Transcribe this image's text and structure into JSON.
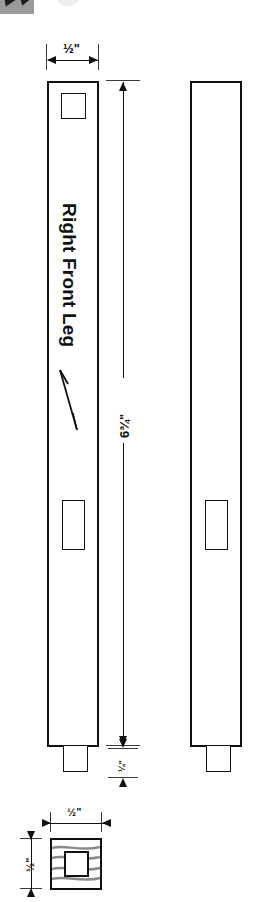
{
  "drawing": {
    "part_label": "Right Front Leg",
    "grain_arrow_icon": "grain-direction-arrow-icon",
    "front_view": {
      "name": "right-front-leg-front-view",
      "width_dimension": "½\"",
      "length_dimension": "6¾\"",
      "tenon_dimension": "¼\""
    },
    "side_view": {
      "name": "right-front-leg-side-view"
    },
    "section_view": {
      "name": "leg-cross-section",
      "width_dimension": "½\"",
      "height_dimension": "½\""
    }
  },
  "thumbnail_strip": {
    "fragment_icon": "cropped-thumbnail-icon",
    "ellipse_icon": "faint-ellipse-icon"
  },
  "colors": {
    "line": "#111111",
    "grain": "#8a8a8a",
    "thumb_bg": "#9a9a9a",
    "paper": "#ffffff"
  }
}
